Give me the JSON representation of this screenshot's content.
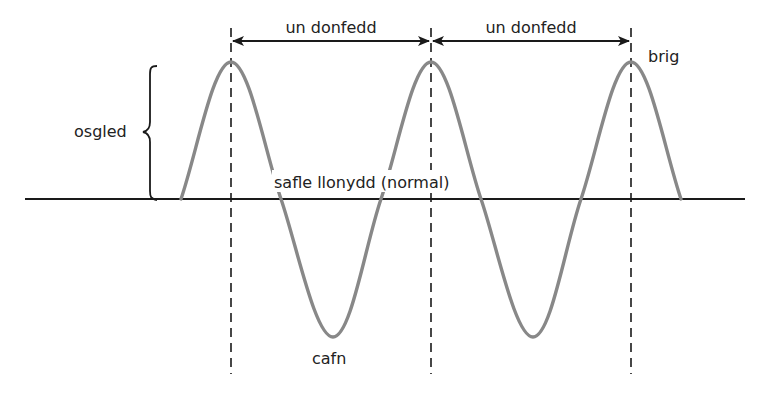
{
  "diagram": {
    "type": "transverse-wave",
    "labels": {
      "wavelength_1": "un donfedd",
      "wavelength_2": "un donfedd",
      "crest": "brig",
      "amplitude": "osgled",
      "rest_position": "safle llonydd (normal)",
      "trough": "cafn"
    },
    "colors": {
      "wave": "#888888",
      "axis": "#1a1a1a",
      "text": "#222222",
      "background": "#ffffff"
    }
  }
}
